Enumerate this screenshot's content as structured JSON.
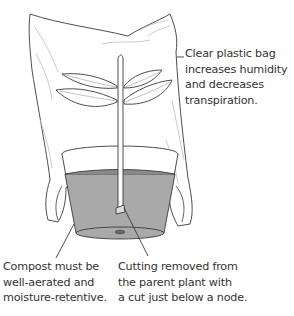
{
  "diagram": {
    "colors": {
      "line": "#3a3a3a",
      "compost_fill": "#a9a9a9",
      "bag_fold": "#bdbdbd",
      "text": "#333333"
    },
    "annotations": [
      {
        "id": "bag",
        "lines": [
          "Clear plastic bag",
          "increases humidity",
          "and decreases",
          "transpiration."
        ]
      },
      {
        "id": "compost",
        "lines": [
          "Compost must be",
          "well-aerated and",
          "moisture-retentive."
        ]
      },
      {
        "id": "cutting",
        "lines": [
          "Cutting removed from",
          "the parent plant with",
          "a cut just below a node."
        ]
      }
    ]
  }
}
